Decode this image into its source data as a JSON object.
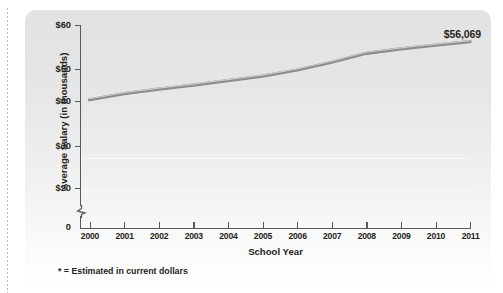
{
  "chart_data": {
    "type": "line",
    "title": "",
    "xlabel": "School Year",
    "ylabel": "Average Salary (in thousands)",
    "categories": [
      "2000",
      "2001",
      "2002",
      "2003",
      "2004",
      "2005",
      "2006",
      "2007",
      "2008",
      "2009",
      "2010",
      "2011"
    ],
    "x": [
      2000,
      2001,
      2002,
      2003,
      2004,
      2005,
      2006,
      2007,
      2008,
      2009,
      2010,
      2011
    ],
    "values": [
      41.8,
      43.3,
      44.4,
      45.4,
      46.5,
      47.6,
      49.1,
      51.0,
      53.2,
      54.3,
      55.2,
      56.069
    ],
    "series": [
      {
        "name": "Average Salary",
        "values": [
          41.8,
          43.3,
          44.4,
          45.4,
          46.5,
          47.6,
          49.1,
          51.0,
          53.2,
          54.3,
          55.2,
          56.069
        ]
      }
    ],
    "ylim": [
      0,
      60
    ],
    "y_ticks": [
      0,
      20,
      30,
      40,
      50,
      60
    ],
    "y_tick_labels": [
      "0",
      "$20",
      "$30",
      "$40",
      "$50",
      "$60"
    ],
    "axis_break": true,
    "axis_break_between": [
      0,
      20
    ],
    "grid": false,
    "legend": "none",
    "data_labels": [
      {
        "category": "2011",
        "text": "$56,069"
      }
    ],
    "footnote": "* = Estimated in current dollars",
    "line_color": "#8a8c8e",
    "panel_color_top": "#e2e2e2",
    "panel_color_bottom": "#ffffff",
    "text_color": "#231f20"
  },
  "axis": {
    "y_title": "Average Salary (in thousands)",
    "x_title": "School Year",
    "y_labels": [
      "$60",
      "$50",
      "$40",
      "$30",
      "$20",
      "0"
    ],
    "x_labels": [
      "2000",
      "2001",
      "2002",
      "2003",
      "2004",
      "2005",
      "2006",
      "2007",
      "2008",
      "2009",
      "2010",
      "2011"
    ]
  },
  "annotations": {
    "end_value": "$56,069",
    "footnote": "* = Estimated in current dollars"
  }
}
